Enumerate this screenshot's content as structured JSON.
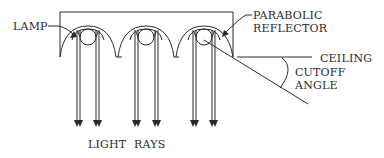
{
  "diagram": {
    "labels": {
      "lamp": "LAMP",
      "reflector_line1": "PARABOLIC",
      "reflector_line2": "REFLECTOR",
      "ceiling": "CEILING",
      "cutoff_line1": "CUTOFF",
      "cutoff_line2": "ANGLE",
      "light_rays": "LIGHT RAYS"
    },
    "reflector_count": 3,
    "rays_per_reflector": 2,
    "colors": {
      "line": "#2a2a2a",
      "background": "#ffffff"
    }
  }
}
